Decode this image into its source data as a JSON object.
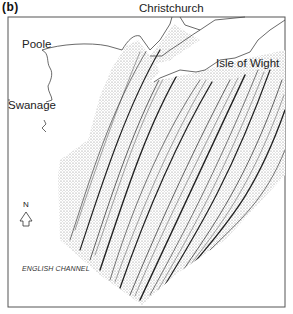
{
  "panel_label": "(b)",
  "places": {
    "christchurch": "Christchurch",
    "poole": "Poole",
    "isle_of_wight": "Isle of Wight",
    "swanage": "Swanage"
  },
  "sea_label": "ENGLISH CHANNEL",
  "north_label": "N",
  "colors": {
    "ink": "#222222",
    "frame": "#555555",
    "background": "#ffffff"
  }
}
